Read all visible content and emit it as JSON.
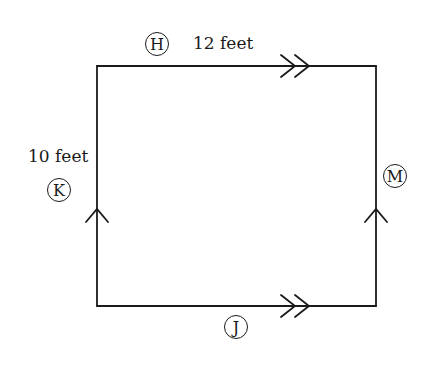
{
  "diagram": {
    "shape": "rectangle",
    "stroke_color": "#1a1a1a",
    "background": "#ffffff",
    "corners": {
      "top_left": [
        97,
        66
      ],
      "top_right": [
        376,
        66
      ],
      "bottom_right": [
        376,
        306
      ],
      "bottom_left": [
        97,
        306
      ]
    },
    "sides": [
      {
        "name": "top",
        "marker": "double-arrow",
        "direction": "right",
        "parallel_group": "horizontal"
      },
      {
        "name": "bottom",
        "marker": "double-arrow",
        "direction": "right",
        "parallel_group": "horizontal"
      },
      {
        "name": "left",
        "marker": "single-arrow",
        "direction": "up",
        "parallel_group": "vertical"
      },
      {
        "name": "right",
        "marker": "single-arrow",
        "direction": "up",
        "parallel_group": "vertical"
      }
    ]
  },
  "labels": {
    "top_length": "12 feet",
    "left_length": "10 feet"
  },
  "circled_labels": {
    "top": "H",
    "left": "K",
    "right": "M",
    "bottom": "J"
  }
}
